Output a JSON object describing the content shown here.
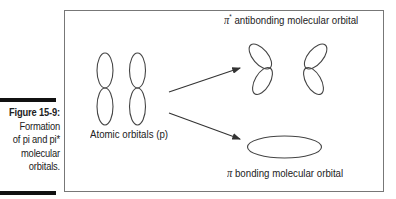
{
  "caption": {
    "figure_label": "Figure 15-9:",
    "lines": [
      "Formation",
      "of pi and pi*",
      "molecular",
      "orbitals."
    ]
  },
  "diagram": {
    "atomic_label": "Atomic orbitals (p)",
    "antibonding": {
      "symbol": "π",
      "superscript": "*",
      "text": "antibonding molecular orbital"
    },
    "bonding": {
      "symbol": "π",
      "text": "bonding molecular orbital"
    }
  },
  "colors": {
    "stroke": "#444444",
    "bar": "#111111",
    "border": "#777777",
    "text": "#222222"
  }
}
